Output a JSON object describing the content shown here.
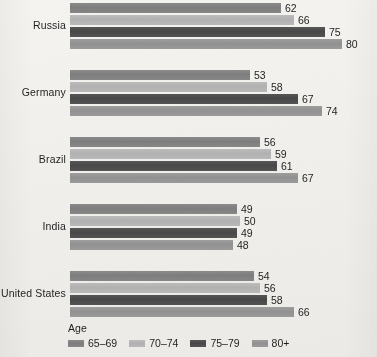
{
  "chart_data": {
    "type": "bar",
    "orientation": "horizontal",
    "title": "",
    "xlabel": "",
    "ylabel": "",
    "grid": false,
    "legend_position": "bottom-left",
    "legend_title": "Age",
    "categories": [
      "Russia",
      "Germany",
      "Brazil",
      "India",
      "United States"
    ],
    "series": [
      {
        "name": "65–69",
        "color": "#828282",
        "values": [
          62,
          53,
          56,
          49,
          54
        ]
      },
      {
        "name": "70–74",
        "color": "#b4b4b4",
        "values": [
          66,
          58,
          59,
          50,
          56
        ]
      },
      {
        "name": "75–79",
        "color": "#4c4c4c",
        "values": [
          75,
          67,
          61,
          49,
          58
        ]
      },
      {
        "name": "80+",
        "color": "#969696",
        "values": [
          80,
          74,
          67,
          48,
          66
        ]
      }
    ],
    "xlim": [
      0,
      80
    ],
    "value_labels_shown": true
  },
  "legend": {
    "title": "Age",
    "items": [
      {
        "label": "65–69"
      },
      {
        "label": "70–74"
      },
      {
        "label": "75–79"
      },
      {
        "label": "80+"
      }
    ]
  },
  "groups": [
    {
      "label": "Russia",
      "bars": [
        {
          "series": "65–69",
          "value": "62"
        },
        {
          "series": "70–74",
          "value": "66"
        },
        {
          "series": "75–79",
          "value": "75"
        },
        {
          "series": "80+",
          "value": "80"
        }
      ]
    },
    {
      "label": "Germany",
      "bars": [
        {
          "series": "65–69",
          "value": "53"
        },
        {
          "series": "70–74",
          "value": "58"
        },
        {
          "series": "75–79",
          "value": "67"
        },
        {
          "series": "80+",
          "value": "74"
        }
      ]
    },
    {
      "label": "Brazil",
      "bars": [
        {
          "series": "65–69",
          "value": "56"
        },
        {
          "series": "70–74",
          "value": "59"
        },
        {
          "series": "75–79",
          "value": "61"
        },
        {
          "series": "80+",
          "value": "67"
        }
      ]
    },
    {
      "label": "India",
      "bars": [
        {
          "series": "65–69",
          "value": "49"
        },
        {
          "series": "70–74",
          "value": "50"
        },
        {
          "series": "75–79",
          "value": "49"
        },
        {
          "series": "80+",
          "value": "48"
        }
      ]
    },
    {
      "label": "United States",
      "bars": [
        {
          "series": "65–69",
          "value": "54"
        },
        {
          "series": "70–74",
          "value": "56"
        },
        {
          "series": "75–79",
          "value": "58"
        },
        {
          "series": "80+",
          "value": "66"
        }
      ]
    }
  ]
}
